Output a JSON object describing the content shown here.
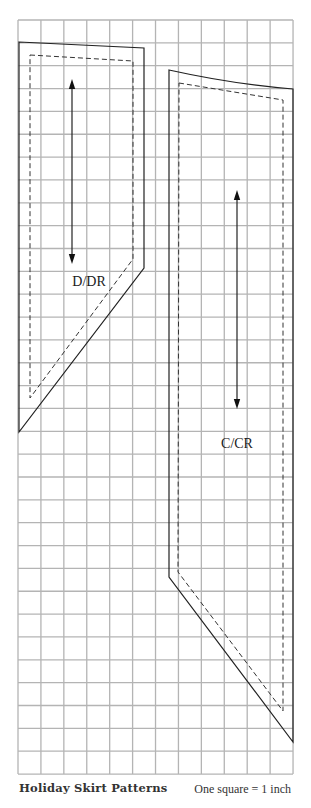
{
  "grid": {
    "left": 18,
    "top": 20,
    "cols": 12,
    "rows": 33,
    "cell_w": 22.92,
    "cell_h": 22.85,
    "line_color": "#b4b4b4",
    "unit": "1 inch"
  },
  "pieces": [
    {
      "label": "D/DR",
      "cut_line": "19,42 144,48 144,268 19,432",
      "seam_line": "30,55 133,61 133,259 30,398",
      "grainline": {
        "x": 72,
        "y1": 79,
        "y2": 264
      },
      "label_pos": {
        "x": 89,
        "y": 286
      }
    },
    {
      "label": "C/CR",
      "cut_line_path": "M169,70 Q232,84 293,89 L293,742 L169,577 Z",
      "seam_line_path": "M179,83 L283,100 L283,711 L178,572 Z",
      "grainline": {
        "x": 237,
        "y1": 190,
        "y2": 409
      },
      "label_pos": {
        "x": 237,
        "y": 448
      }
    }
  ],
  "caption": {
    "title": "Holiday Skirt Patterns",
    "scale": "One square = 1 inch"
  },
  "colors": {
    "outline": "#222222",
    "grid": "#b4b4b4",
    "text": "#333333"
  }
}
